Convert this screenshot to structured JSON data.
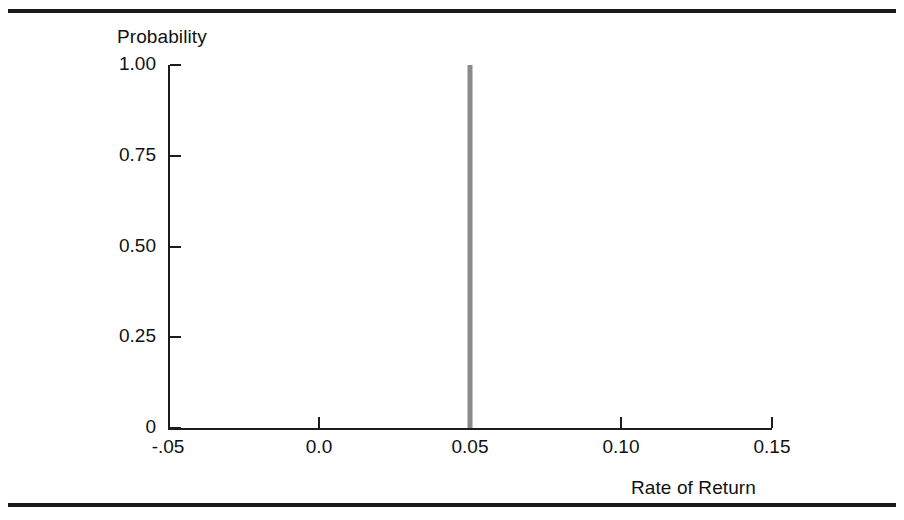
{
  "figure": {
    "top_rule": "",
    "bottom_rule": ""
  },
  "chart_data": {
    "type": "bar",
    "title": "",
    "xlabel": "Rate of Return",
    "ylabel": "Probability",
    "xlim": [
      -0.05,
      0.15
    ],
    "ylim": [
      0,
      1.0
    ],
    "grid": false,
    "legend": null,
    "x_tick_labels": [
      "-.05",
      "0.0",
      "0.05",
      "0.10",
      "0.15"
    ],
    "x_tick_values": [
      -0.05,
      0.0,
      0.05,
      0.1,
      0.15
    ],
    "y_tick_labels": [
      "1.00",
      "0.75",
      "0.50",
      "0.25",
      "0"
    ],
    "y_tick_values": [
      1.0,
      0.75,
      0.5,
      0.25,
      0
    ],
    "categories": [
      0.05
    ],
    "values": [
      1.0
    ],
    "bar_color": "#8a8a8a",
    "annotation": "Single point mass: probability 1.00 at a rate of return of 0.05"
  }
}
